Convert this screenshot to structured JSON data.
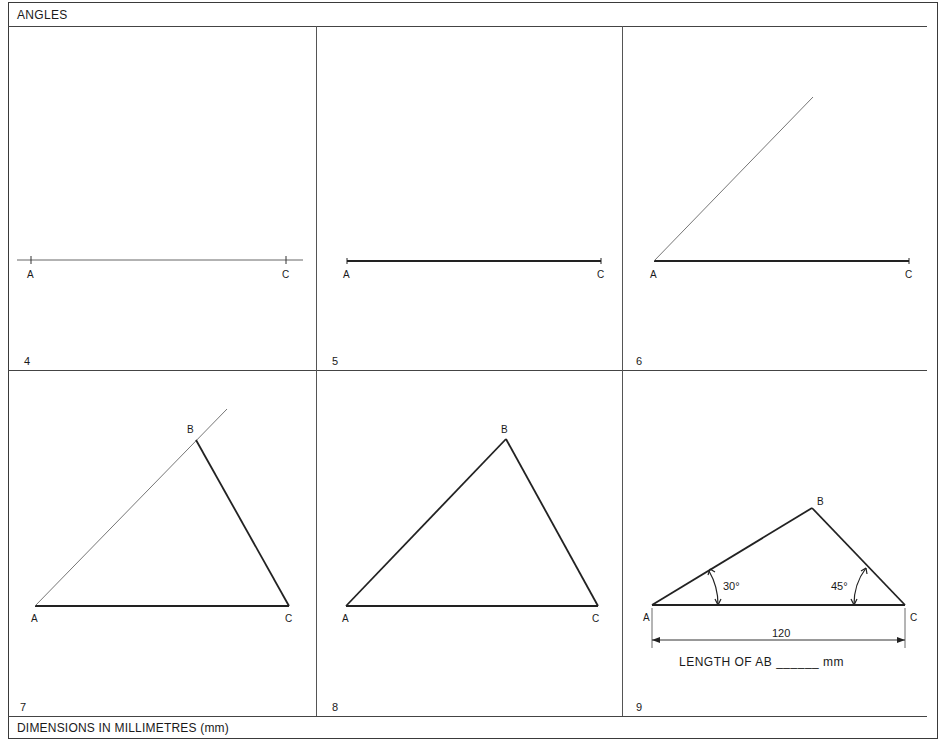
{
  "header": {
    "title": "ANGLES"
  },
  "footer": {
    "note": "DIMENSIONS IN MILLIMETRES (mm)"
  },
  "panels": [
    {
      "number": "4",
      "labels": {
        "a": "A",
        "c": "C"
      }
    },
    {
      "number": "5",
      "labels": {
        "a": "A",
        "c": "C"
      }
    },
    {
      "number": "6",
      "labels": {
        "a": "A",
        "c": "C"
      }
    },
    {
      "number": "7",
      "labels": {
        "a": "A",
        "b": "B",
        "c": "C"
      }
    },
    {
      "number": "8",
      "labels": {
        "a": "A",
        "b": "B",
        "c": "C"
      }
    },
    {
      "number": "9",
      "labels": {
        "a": "A",
        "b": "B",
        "c": "C"
      },
      "angle_a": "30°",
      "angle_c": "45°",
      "base_length": "120",
      "question": "LENGTH OF AB ______ mm"
    }
  ]
}
